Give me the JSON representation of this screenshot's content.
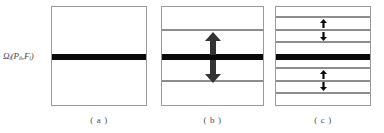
{
  "figure": {
    "axis_label": {
      "base": "Ω",
      "base_sub": "i",
      "open": "(P",
      "p_sub": "ii",
      "comma": ",F",
      "f_sub": "i",
      "close": ")",
      "plain": "Ωi(Pii,Fi)"
    },
    "colors": {
      "band_black": "#0a0a0a",
      "line_gray": "#8d8d8d",
      "panel_border": "#9a9a9a",
      "arrow_fill": "#333333",
      "background": "#ffffff",
      "text": "#4f4f4f"
    },
    "panels": [
      {
        "id": "a",
        "caption": "( a )",
        "bands": [
          {
            "name": "central-black-band",
            "kind": "black",
            "top_pct": 48.0,
            "height_px": 6
          }
        ],
        "arrows": []
      },
      {
        "id": "b",
        "caption": "( b )",
        "bands": [
          {
            "name": "upper-gray-line",
            "kind": "gray",
            "top_pct": 22.0,
            "height_px": 2
          },
          {
            "name": "central-black-band",
            "kind": "black",
            "top_pct": 48.0,
            "height_px": 6
          },
          {
            "name": "lower-gray-line",
            "kind": "gray",
            "top_pct": 74.0,
            "height_px": 2
          }
        ],
        "arrows": [
          {
            "name": "up-block-arrow",
            "direction": "up",
            "left_pct": 50.0,
            "top_pct": 25.0
          },
          {
            "name": "down-block-arrow",
            "direction": "down",
            "left_pct": 50.0,
            "top_pct": 54.0
          }
        ]
      },
      {
        "id": "c",
        "caption": "( c )",
        "bands": [
          {
            "name": "gray-line-1",
            "kind": "gray",
            "top_pct": 9.0,
            "height_px": 2
          },
          {
            "name": "gray-line-2",
            "kind": "gray",
            "top_pct": 22.0,
            "height_px": 2
          },
          {
            "name": "gray-line-3",
            "kind": "gray",
            "top_pct": 35.0,
            "height_px": 2
          },
          {
            "name": "central-black-band",
            "kind": "black",
            "top_pct": 48.0,
            "height_px": 6
          },
          {
            "name": "gray-line-4",
            "kind": "gray",
            "top_pct": 61.0,
            "height_px": 2
          },
          {
            "name": "gray-line-5",
            "kind": "gray",
            "top_pct": 74.0,
            "height_px": 2
          },
          {
            "name": "gray-line-6",
            "kind": "gray",
            "top_pct": 87.0,
            "height_px": 2
          }
        ],
        "arrows": [
          {
            "name": "small-up-arrow-1",
            "direction": "up",
            "left_pct": 50.0,
            "top_pct": 12.0
          },
          {
            "name": "small-down-arrow-1",
            "direction": "down",
            "left_pct": 50.0,
            "top_pct": 25.0
          },
          {
            "name": "small-up-arrow-2",
            "direction": "up",
            "left_pct": 50.0,
            "top_pct": 64.0
          },
          {
            "name": "small-down-arrow-2",
            "direction": "down",
            "left_pct": 50.0,
            "top_pct": 77.0
          }
        ]
      }
    ]
  }
}
